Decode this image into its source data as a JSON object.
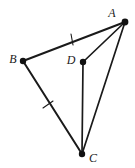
{
  "figure": {
    "type": "geometry-diagram",
    "width": 135,
    "height": 168,
    "background_color": "#ffffff",
    "stroke_color": "#1a1a1a",
    "label_color": "#1a1a1a",
    "points": [
      {
        "id": "A",
        "label": "A",
        "x": 125,
        "y": 22,
        "label_x": 112,
        "label_y": 14,
        "dot_radius": 3.4
      },
      {
        "id": "B",
        "label": "B",
        "x": 23,
        "y": 61,
        "label_x": 13,
        "label_y": 60,
        "dot_radius": 3.2
      },
      {
        "id": "C",
        "label": "C",
        "x": 82,
        "y": 154,
        "label_x": 93,
        "label_y": 159,
        "dot_radius": 3.2
      },
      {
        "id": "D",
        "label": "D",
        "x": 83,
        "y": 62,
        "label_x": 71,
        "label_y": 61,
        "dot_radius": 3.2
      }
    ],
    "segments": [
      {
        "id": "AB",
        "from": "A",
        "to": "B",
        "x1": 125,
        "y1": 22,
        "x2": 23,
        "y2": 61,
        "width": 2.0,
        "ticks": 1
      },
      {
        "id": "BC",
        "from": "B",
        "to": "C",
        "x1": 23,
        "y1": 61,
        "x2": 82,
        "y2": 154,
        "width": 2.0,
        "ticks": 1
      },
      {
        "id": "AC",
        "from": "A",
        "to": "C",
        "x1": 125,
        "y1": 22,
        "x2": 82,
        "y2": 154,
        "width": 1.7,
        "ticks": 0
      },
      {
        "id": "AD",
        "from": "A",
        "to": "D",
        "x1": 125,
        "y1": 22,
        "x2": 83,
        "y2": 62,
        "width": 1.7,
        "ticks": 0
      },
      {
        "id": "DC",
        "from": "D",
        "to": "C",
        "x1": 83,
        "y1": 62,
        "x2": 82,
        "y2": 154,
        "width": 1.7,
        "ticks": 0
      }
    ],
    "tick_marks": [
      {
        "id": "tick-AB",
        "on_segment": "AB",
        "x": 72,
        "y": 39,
        "angle_deg": 100,
        "length": 11
      },
      {
        "id": "tick-BC",
        "on_segment": "BC",
        "x": 48,
        "y": 105,
        "angle_deg": 35,
        "length": 11
      }
    ],
    "congruence_note": "AB and BC carry single tick marks indicating equal length"
  }
}
